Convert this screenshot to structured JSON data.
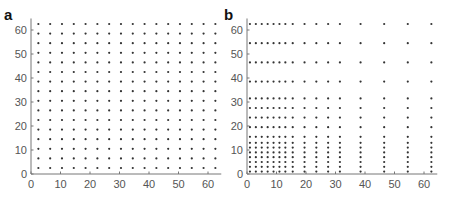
{
  "chart_data": [
    {
      "panel": "a",
      "type": "scatter",
      "title": "",
      "xlabel": "",
      "ylabel": "",
      "xlim": [
        0,
        64
      ],
      "ylim": [
        0,
        64
      ],
      "grid": false,
      "xticks": [
        0,
        10,
        20,
        30,
        40,
        50,
        60
      ],
      "yticks": [
        0,
        10,
        20,
        30,
        40,
        50,
        60
      ],
      "description": "Uniform 16x16 grid of points",
      "x_levels": [
        2.5,
        6.5,
        10.5,
        14.5,
        18.5,
        22.5,
        26.5,
        30.5,
        34.5,
        38.5,
        42.5,
        46.5,
        50.5,
        54.5,
        58.5,
        62.5
      ],
      "y_levels": [
        2.5,
        6.5,
        10.5,
        14.5,
        18.5,
        22.5,
        26.5,
        30.5,
        34.5,
        38.5,
        42.5,
        46.5,
        50.5,
        54.5,
        58.5,
        62.5
      ]
    },
    {
      "panel": "b",
      "type": "scatter",
      "title": "",
      "xlabel": "",
      "ylabel": "",
      "xlim": [
        0,
        64
      ],
      "ylim": [
        0,
        64
      ],
      "grid": false,
      "xticks": [
        0,
        10,
        20,
        30,
        40,
        50,
        60
      ],
      "yticks": [
        0,
        10,
        20,
        30,
        40,
        50,
        60
      ],
      "description": "Non-uniform (dyadic) 16x16 grid of points, dense near origin",
      "x_levels": [
        1,
        3,
        5,
        7,
        9,
        11,
        13,
        15.5,
        19.5,
        23.5,
        27.5,
        31.5,
        38.5,
        46.5,
        54.5,
        62.5
      ],
      "y_levels": [
        1,
        3,
        5,
        7,
        9,
        11,
        13,
        15.5,
        19.5,
        23.5,
        27.5,
        31.5,
        38.5,
        46.5,
        54.5,
        62.5
      ]
    }
  ],
  "panels": [
    {
      "label": "a"
    },
    {
      "label": "b"
    }
  ]
}
